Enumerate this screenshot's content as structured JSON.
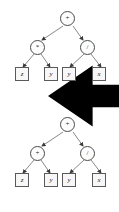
{
  "figure": {
    "background_color": "#ffffff",
    "node_stroke_color": "#4a4a4a",
    "leaf_fill_color": "#f7f7f7",
    "edge_color": "#6e6e6e",
    "arrow_color": "#000000"
  },
  "trees": [
    {
      "id": "tree-top",
      "name": "top-expression-tree",
      "root": {
        "label": "+",
        "name": "root-operator-plus",
        "shape": "circle"
      },
      "children": [
        {
          "label": "*",
          "name": "left-operator-times",
          "shape": "circle"
        },
        {
          "label": "/",
          "name": "right-operator-divide",
          "shape": "circle"
        }
      ],
      "leaves": [
        {
          "label": "z",
          "name": "leaf-z",
          "shape": "box"
        },
        {
          "label": "y",
          "name": "leaf-y-1",
          "shape": "box"
        },
        {
          "label": "y",
          "name": "leaf-y-2",
          "shape": "box"
        },
        {
          "label": "x",
          "name": "leaf-x",
          "shape": "box"
        }
      ],
      "annotation": {
        "type": "arrow",
        "name": "pointer-arrow-left",
        "direction": "left",
        "points_to": "left-operator-times"
      }
    },
    {
      "id": "tree-bottom",
      "name": "bottom-expression-tree",
      "root": {
        "label": "+",
        "name": "root-operator-plus",
        "shape": "circle"
      },
      "children": [
        {
          "label": "+",
          "name": "left-operator-plus",
          "shape": "circle"
        },
        {
          "label": "/",
          "name": "right-operator-divide",
          "shape": "circle"
        }
      ],
      "leaves": [
        {
          "label": "z",
          "name": "leaf-z",
          "shape": "box"
        },
        {
          "label": "y",
          "name": "leaf-y-1",
          "shape": "box"
        },
        {
          "label": "y",
          "name": "leaf-y-2",
          "shape": "box"
        },
        {
          "label": "x",
          "name": "leaf-x",
          "shape": "box"
        }
      ],
      "annotation": null
    }
  ]
}
